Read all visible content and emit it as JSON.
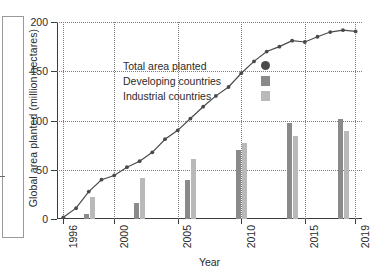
{
  "chart_data": {
    "type": "line",
    "title": "",
    "xlabel": "Year",
    "ylabel": "Global area planted (million hectares)",
    "xlim": [
      1995.5,
      2019.5
    ],
    "ylim": [
      0,
      200
    ],
    "yticks": [
      0,
      50,
      100,
      150,
      200
    ],
    "xticks": [
      1996,
      2000,
      2005,
      2010,
      2015,
      2019
    ],
    "grid": "dotted both axes",
    "legend_position": "upper-left inside plot",
    "legend": [
      {
        "label": "Total area planted",
        "marker": "circle",
        "color": "#4a4a4a"
      },
      {
        "label": "Developing countries",
        "marker": "square",
        "color": "#8a8a8a"
      },
      {
        "label": "Industrial countries",
        "marker": "square",
        "color": "#b9b9b9"
      }
    ],
    "series": [
      {
        "name": "Total area planted",
        "type": "line",
        "color": "#4a4a4a",
        "x": [
          1996,
          1997,
          1998,
          1999,
          2000,
          2001,
          2002,
          2003,
          2004,
          2005,
          2006,
          2007,
          2008,
          2009,
          2010,
          2011,
          2012,
          2013,
          2014,
          2015,
          2016,
          2017,
          2018,
          2019
        ],
        "values": [
          1.7,
          11,
          27.8,
          39.9,
          44.2,
          52.6,
          58.7,
          67.7,
          81,
          90,
          102,
          114,
          125,
          134,
          148,
          160,
          170,
          175,
          181,
          179.7,
          185,
          189.8,
          191.7,
          190.4
        ]
      },
      {
        "name": "Developing countries",
        "type": "bar",
        "color": "#8a8a8a",
        "x": [
          1998,
          2002,
          2006,
          2010,
          2014,
          2018
        ],
        "values": [
          5,
          16,
          40,
          70,
          97,
          102
        ]
      },
      {
        "name": "Industrial countries",
        "type": "bar",
        "color": "#b9b9b9",
        "x": [
          1998,
          2002,
          2006,
          2010,
          2014,
          2018
        ],
        "values": [
          22,
          42,
          61,
          77,
          84,
          89
        ]
      }
    ]
  },
  "axes": {
    "y_tick_labels": [
      "0",
      "50",
      "100",
      "150",
      "200"
    ],
    "x_tick_labels": [
      "1996",
      "2000",
      "2005",
      "2010",
      "2015",
      "2019"
    ],
    "x_title": "Year",
    "y_title": "Global area planted (million hectares)"
  }
}
